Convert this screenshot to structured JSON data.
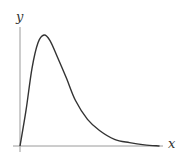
{
  "chart_data": {
    "type": "line",
    "title": "",
    "xlabel": "x",
    "ylabel": "y",
    "grid": false,
    "legend": null,
    "x": [
      0,
      0.04,
      0.08,
      0.12,
      0.16,
      0.2,
      0.25,
      0.31,
      0.37,
      0.45,
      0.53,
      0.63,
      0.73,
      0.83,
      0.93
    ],
    "series": [
      {
        "name": "curve",
        "values": [
          0,
          0.32,
          0.7,
          0.93,
          1.0,
          0.95,
          0.8,
          0.61,
          0.41,
          0.24,
          0.14,
          0.06,
          0.03,
          0.01,
          0.0
        ]
      }
    ],
    "xlim": [
      0,
      1
    ],
    "ylim": [
      0,
      1.07
    ],
    "colors": {
      "curve": "#333333",
      "axes": "#8a8a8a"
    }
  },
  "labels": {
    "x_axis": "x",
    "y_axis": "y"
  }
}
